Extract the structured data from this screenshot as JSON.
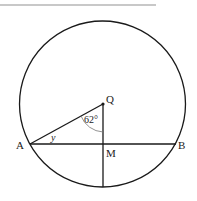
{
  "diagram": {
    "labels": {
      "center": "Q",
      "chord_left": "A",
      "chord_right": "B",
      "midpoint": "M",
      "angle_at_Q": "62°",
      "angle_at_A": "y"
    },
    "colors": {
      "stroke": "#1a1a1a",
      "top_rule": "#c8c8c8"
    }
  }
}
